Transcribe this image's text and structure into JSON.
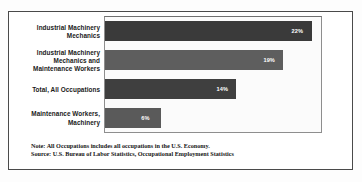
{
  "frame": {
    "border_color": "#4a4a4a",
    "background": "#ffffff"
  },
  "footnote": {
    "note": "Note: All Occupations includes all occupations in the U.S. Economy.",
    "source": "Source: U.S. Bureau of Labor Statistics, Occupational Employment Statistics"
  },
  "chart_data": {
    "type": "bar",
    "orientation": "horizontal",
    "title": "",
    "subtitle": "",
    "xlabel": "",
    "ylabel": "",
    "xlim": [
      0,
      23
    ],
    "grid": false,
    "legend": false,
    "categories": [
      "Industrial Machinery Mechanics",
      "Industrial Machinery Mechanics and Maintenance Workers",
      "Total, All Occupations",
      "Maintenance Workers, Machinery"
    ],
    "values": [
      22,
      19,
      14,
      6
    ],
    "data_labels": [
      "22%",
      "19%",
      "14%",
      "6%"
    ],
    "bar_colors": [
      "#3a3a3a",
      "#5e5e5e",
      "#3f3f3f",
      "#5a5a5a"
    ],
    "bars": [
      {
        "category": "Industrial Machinery Mechanics",
        "label_lines": [
          "Industrial Machinery",
          "Mechanics"
        ],
        "value": 22,
        "data_label": "22%",
        "color": "#3a3a3a"
      },
      {
        "category": "Industrial Machinery Mechanics and Maintenance Workers",
        "label_lines": [
          "Industrial Machinery",
          "Mechanics and",
          "Maintenance Workers"
        ],
        "value": 19,
        "data_label": "19%",
        "color": "#5e5e5e"
      },
      {
        "category": "Total, All Occupations",
        "label_lines": [
          "Total, All Occupations"
        ],
        "value": 14,
        "data_label": "14%",
        "color": "#3f3f3f"
      },
      {
        "category": "Maintenance Workers, Machinery",
        "label_lines": [
          "Maintenance Workers,",
          "Machinery"
        ],
        "value": 6,
        "data_label": "6%",
        "color": "#5a5a5a"
      }
    ]
  }
}
